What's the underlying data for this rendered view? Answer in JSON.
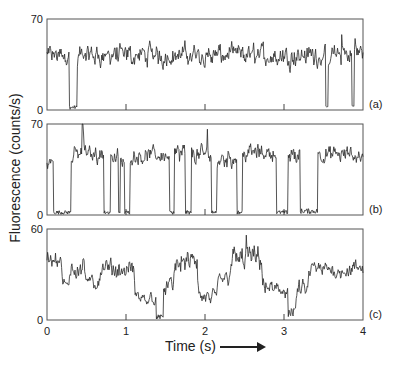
{
  "chart_data": {
    "type": "line",
    "title": "",
    "xlabel": "Time (s)",
    "ylabel": "Fluorescence (counts/s)",
    "xlim": [
      0,
      4
    ],
    "xticks": [
      0,
      1,
      2,
      3,
      4
    ],
    "grid": false,
    "legend": null,
    "panels": [
      {
        "label": "(a)",
        "ylim": [
          0,
          70
        ],
        "yticks": [
          "0",
          "70"
        ],
        "description": "Mostly high fluorescence (~40 counts/s) with brief dark (off) periods",
        "segments": [
          {
            "t0": 0.0,
            "t1": 0.28,
            "level": 42,
            "noise": 8
          },
          {
            "t0": 0.28,
            "t1": 0.38,
            "level": 2,
            "noise": 1.5
          },
          {
            "t0": 0.38,
            "t1": 3.53,
            "level": 42,
            "noise": 9
          },
          {
            "t0": 3.53,
            "t1": 3.56,
            "level": 2,
            "noise": 1
          },
          {
            "t0": 3.56,
            "t1": 3.86,
            "level": 42,
            "noise": 9
          },
          {
            "t0": 3.86,
            "t1": 3.89,
            "level": 3,
            "noise": 1
          },
          {
            "t0": 3.89,
            "t1": 4.0,
            "level": 44,
            "noise": 9
          }
        ],
        "spikes": [
          {
            "t": 3.9,
            "value": 55
          },
          {
            "t": 3.73,
            "value": 58
          }
        ]
      },
      {
        "label": "(b)",
        "ylim": [
          0,
          70
        ],
        "yticks": [
          "0",
          "70"
        ],
        "description": "Telegraph-like switching between on (~45 counts/s) and off (~2 counts/s) states",
        "segments": [
          {
            "t0": 0.0,
            "t1": 0.08,
            "level": 40,
            "noise": 6
          },
          {
            "t0": 0.08,
            "t1": 0.3,
            "level": 2,
            "noise": 1.5
          },
          {
            "t0": 0.3,
            "t1": 0.72,
            "level": 47,
            "noise": 7
          },
          {
            "t0": 0.72,
            "t1": 0.8,
            "level": 2,
            "noise": 1.5
          },
          {
            "t0": 0.8,
            "t1": 0.9,
            "level": 44,
            "noise": 8
          },
          {
            "t0": 0.9,
            "t1": 0.93,
            "level": 2,
            "noise": 1
          },
          {
            "t0": 0.93,
            "t1": 0.98,
            "level": 40,
            "noise": 6
          },
          {
            "t0": 0.98,
            "t1": 1.05,
            "level": 2,
            "noise": 1.5
          },
          {
            "t0": 1.05,
            "t1": 1.55,
            "level": 46,
            "noise": 7
          },
          {
            "t0": 1.55,
            "t1": 1.61,
            "level": 2,
            "noise": 1.5
          },
          {
            "t0": 1.61,
            "t1": 1.75,
            "level": 46,
            "noise": 9
          },
          {
            "t0": 1.75,
            "t1": 1.83,
            "level": 2,
            "noise": 1.5
          },
          {
            "t0": 1.83,
            "t1": 2.08,
            "level": 46,
            "noise": 8
          },
          {
            "t0": 2.08,
            "t1": 2.15,
            "level": 2,
            "noise": 1.5
          },
          {
            "t0": 2.15,
            "t1": 2.4,
            "level": 44,
            "noise": 8
          },
          {
            "t0": 2.4,
            "t1": 2.47,
            "level": 2,
            "noise": 1.5
          },
          {
            "t0": 2.47,
            "t1": 2.9,
            "level": 48,
            "noise": 7
          },
          {
            "t0": 2.9,
            "t1": 3.05,
            "level": 2,
            "noise": 1.5
          },
          {
            "t0": 3.05,
            "t1": 3.2,
            "level": 46,
            "noise": 9
          },
          {
            "t0": 3.2,
            "t1": 3.43,
            "level": 3,
            "noise": 2
          },
          {
            "t0": 3.43,
            "t1": 4.0,
            "level": 46,
            "noise": 7
          }
        ],
        "spikes": [
          {
            "t": 0.45,
            "value": 70
          },
          {
            "t": 2.03,
            "value": 66
          }
        ]
      },
      {
        "label": "(c)",
        "ylim": [
          0,
          60
        ],
        "yticks": [
          "0",
          "60"
        ],
        "description": "Fluctuating intensity among multiple levels with occasional near-zero dips",
        "segments": [
          {
            "t0": 0.0,
            "t1": 0.18,
            "level": 40,
            "noise": 6
          },
          {
            "t0": 0.18,
            "t1": 0.28,
            "level": 22,
            "noise": 5
          },
          {
            "t0": 0.28,
            "t1": 0.48,
            "level": 36,
            "noise": 8
          },
          {
            "t0": 0.48,
            "t1": 0.65,
            "level": 24,
            "noise": 6
          },
          {
            "t0": 0.65,
            "t1": 1.1,
            "level": 33,
            "noise": 7
          },
          {
            "t0": 1.1,
            "t1": 1.38,
            "level": 14,
            "noise": 5
          },
          {
            "t0": 1.38,
            "t1": 1.47,
            "level": 2,
            "noise": 1.5
          },
          {
            "t0": 1.47,
            "t1": 1.6,
            "level": 22,
            "noise": 6
          },
          {
            "t0": 1.6,
            "t1": 1.9,
            "level": 38,
            "noise": 8
          },
          {
            "t0": 1.9,
            "t1": 2.15,
            "level": 14,
            "noise": 6
          },
          {
            "t0": 2.15,
            "t1": 2.3,
            "level": 28,
            "noise": 6
          },
          {
            "t0": 2.3,
            "t1": 2.72,
            "level": 40,
            "noise": 9
          },
          {
            "t0": 2.72,
            "t1": 3.05,
            "level": 20,
            "noise": 7
          },
          {
            "t0": 3.05,
            "t1": 3.15,
            "level": 5,
            "noise": 3
          },
          {
            "t0": 3.15,
            "t1": 3.3,
            "level": 20,
            "noise": 6
          },
          {
            "t0": 3.3,
            "t1": 4.0,
            "level": 33,
            "noise": 6
          }
        ],
        "spikes": [
          {
            "t": 2.52,
            "value": 56
          }
        ]
      }
    ]
  }
}
